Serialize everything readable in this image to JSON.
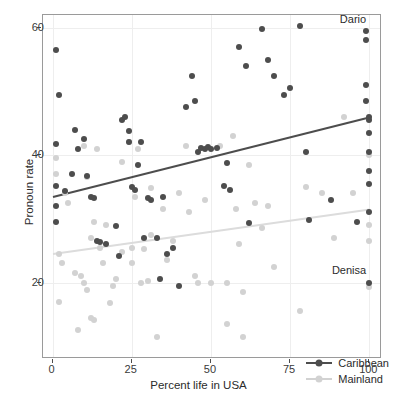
{
  "chart_data": {
    "type": "scatter",
    "title": "",
    "xlabel": "Percent life in USA",
    "ylabel": "Pronoun rate",
    "xlim": [
      -3,
      104
    ],
    "ylim": [
      8,
      62
    ],
    "xticks": [
      0,
      25,
      50,
      75,
      100
    ],
    "yticks": [
      20,
      40,
      60
    ],
    "xticklabels": [
      "0",
      "25",
      "50",
      "75",
      "100"
    ],
    "yticklabels": [
      "20",
      "40",
      "60"
    ],
    "grid": true,
    "legend_position": "bottom-right",
    "colors": {
      "caribbean": "#4d4d4d",
      "mainland": "#d2d2d2",
      "panel_border": "#9a9a9a",
      "gridline": "#eeeeee",
      "background": "#ffffff"
    },
    "series": [
      {
        "name": "Caribbean",
        "color": "#4d4d4d",
        "points": [
          [
            1,
            56.5
          ],
          [
            2,
            49.5
          ],
          [
            1,
            41.8
          ],
          [
            1,
            35.2
          ],
          [
            1,
            32.0
          ],
          [
            1,
            29.5
          ],
          [
            4,
            34.3
          ],
          [
            6,
            37.0
          ],
          [
            7,
            44.0
          ],
          [
            8,
            41.0
          ],
          [
            10,
            42.5
          ],
          [
            11,
            36.8
          ],
          [
            12,
            33.5
          ],
          [
            13,
            33.3
          ],
          [
            14,
            26.5
          ],
          [
            15,
            26.3
          ],
          [
            17,
            26.0
          ],
          [
            20,
            28.8
          ],
          [
            21,
            24.2
          ],
          [
            22,
            45.5
          ],
          [
            23,
            46.0
          ],
          [
            24,
            43.8
          ],
          [
            24,
            42.0
          ],
          [
            25,
            35.0
          ],
          [
            26,
            34.5
          ],
          [
            27,
            38.5
          ],
          [
            28,
            42.0
          ],
          [
            29,
            27.0
          ],
          [
            30,
            33.2
          ],
          [
            31,
            33.0
          ],
          [
            33,
            27.0
          ],
          [
            34,
            20.5
          ],
          [
            35,
            33.5
          ],
          [
            36,
            24.5
          ],
          [
            38,
            25.5
          ],
          [
            40,
            19.5
          ],
          [
            42,
            47.5
          ],
          [
            44,
            52.5
          ],
          [
            45,
            48.5
          ],
          [
            46,
            40.5
          ],
          [
            47,
            41.2
          ],
          [
            48,
            41.0
          ],
          [
            49,
            41.3
          ],
          [
            50,
            41.0
          ],
          [
            52,
            41.2
          ],
          [
            54,
            35.2
          ],
          [
            55,
            38.8
          ],
          [
            56,
            34.5
          ],
          [
            59,
            57.0
          ],
          [
            61,
            54.0
          ],
          [
            62,
            29.3
          ],
          [
            66,
            59.8
          ],
          [
            68,
            55.0
          ],
          [
            70,
            52.5
          ],
          [
            73,
            49.5
          ],
          [
            75,
            50.5
          ],
          [
            78,
            60.2
          ],
          [
            80,
            40.5
          ],
          [
            81,
            29.8
          ],
          [
            88,
            33.0
          ],
          [
            96,
            29.5
          ],
          [
            99,
            59.5
          ],
          [
            99,
            58.0
          ],
          [
            99,
            51.0
          ],
          [
            99,
            48.5
          ],
          [
            100,
            46.0
          ],
          [
            100,
            45.5
          ],
          [
            100,
            43.5
          ],
          [
            100,
            40.5
          ],
          [
            100,
            37.5
          ],
          [
            100,
            35.5
          ],
          [
            100,
            31.0
          ],
          [
            100,
            20.0
          ]
        ]
      },
      {
        "name": "Mainland",
        "color": "#d2d2d2",
        "points": [
          [
            1,
            39.5
          ],
          [
            1,
            37.0
          ],
          [
            2,
            24.5
          ],
          [
            2,
            17.0
          ],
          [
            3,
            23.0
          ],
          [
            4,
            34.0
          ],
          [
            5,
            32.5
          ],
          [
            7,
            21.5
          ],
          [
            8,
            12.5
          ],
          [
            9,
            21.0
          ],
          [
            10,
            20.0
          ],
          [
            10,
            41.5
          ],
          [
            11,
            36.5
          ],
          [
            11,
            18.8
          ],
          [
            12,
            27.0
          ],
          [
            12,
            14.5
          ],
          [
            13,
            29.5
          ],
          [
            13,
            14.2
          ],
          [
            14,
            41.0
          ],
          [
            15,
            25.5
          ],
          [
            16,
            23.0
          ],
          [
            17,
            29.0
          ],
          [
            18,
            16.8
          ],
          [
            19,
            19.5
          ],
          [
            20,
            20.5
          ],
          [
            22,
            39.0
          ],
          [
            22,
            24.8
          ],
          [
            24,
            42.0
          ],
          [
            25,
            25.5
          ],
          [
            25,
            23.0
          ],
          [
            26,
            33.5
          ],
          [
            27,
            41.0
          ],
          [
            28,
            20.0
          ],
          [
            29,
            25.3
          ],
          [
            30,
            20.2
          ],
          [
            31,
            34.8
          ],
          [
            31,
            27.5
          ],
          [
            33,
            11.5
          ],
          [
            35,
            31.5
          ],
          [
            36,
            23.5
          ],
          [
            38,
            26.5
          ],
          [
            40,
            34.0
          ],
          [
            42,
            41.5
          ],
          [
            43,
            31.0
          ],
          [
            45,
            21.0
          ],
          [
            46,
            20.0
          ],
          [
            48,
            33.0
          ],
          [
            50,
            20.0
          ],
          [
            53,
            41.5
          ],
          [
            55,
            20.0
          ],
          [
            55,
            13.5
          ],
          [
            57,
            43.0
          ],
          [
            58,
            31.5
          ],
          [
            59,
            26.0
          ],
          [
            60,
            18.5
          ],
          [
            60,
            11.5
          ],
          [
            62,
            38.5
          ],
          [
            64,
            32.5
          ],
          [
            66,
            28.5
          ],
          [
            68,
            32.0
          ],
          [
            70,
            22.5
          ],
          [
            78,
            15.5
          ],
          [
            80,
            35.0
          ],
          [
            85,
            34.0
          ],
          [
            89,
            27.0
          ],
          [
            92,
            46.0
          ],
          [
            95,
            34.0
          ],
          [
            100,
            40.0
          ],
          [
            100,
            29.0
          ],
          [
            100,
            26.5
          ],
          [
            100,
            19.3
          ]
        ]
      }
    ],
    "trendlines": [
      {
        "name": "Caribbean",
        "color": "#4d4d4d",
        "x0": 0,
        "y0": 33.5,
        "x1": 100,
        "y1": 46.0
      },
      {
        "name": "Mainland",
        "color": "#dcdcdc",
        "x0": 0,
        "y0": 24.5,
        "x1": 100,
        "y1": 31.5
      }
    ],
    "annotations": [
      {
        "text": "Dario",
        "x": 99,
        "y": 61.4,
        "align": "right"
      },
      {
        "text": "Denisa",
        "x": 99,
        "y": 22.0,
        "align": "right"
      }
    ],
    "legend": {
      "entries": [
        {
          "label": "Caribbean",
          "color": "#4d4d4d"
        },
        {
          "label": "Mainland",
          "color": "#d2d2d2"
        }
      ]
    }
  }
}
